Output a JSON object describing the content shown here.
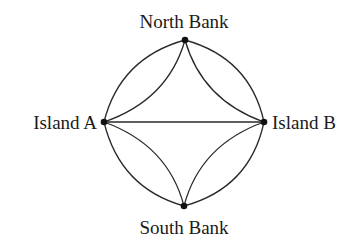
{
  "diagram": {
    "type": "multigraph",
    "nodes": [
      {
        "id": "north",
        "label": "North Bank",
        "x": 185,
        "y": 40
      },
      {
        "id": "islandA",
        "label": "Island A",
        "x": 104,
        "y": 122
      },
      {
        "id": "islandB",
        "label": "Island B",
        "x": 264,
        "y": 122
      },
      {
        "id": "south",
        "label": "South Bank",
        "x": 184,
        "y": 206
      }
    ],
    "edges": [
      {
        "from": "islandA",
        "to": "north",
        "style": "outer-arc"
      },
      {
        "from": "islandA",
        "to": "north",
        "style": "inner-arc"
      },
      {
        "from": "north",
        "to": "islandB",
        "style": "outer-arc"
      },
      {
        "from": "north",
        "to": "islandB",
        "style": "inner-arc"
      },
      {
        "from": "islandA",
        "to": "islandB",
        "style": "straight"
      },
      {
        "from": "islandA",
        "to": "south",
        "style": "outer-arc"
      },
      {
        "from": "islandA",
        "to": "south",
        "style": "inner-arc"
      },
      {
        "from": "south",
        "to": "islandB",
        "style": "outer-arc"
      },
      {
        "from": "south",
        "to": "islandB",
        "style": "inner-arc"
      }
    ]
  },
  "labels": {
    "north": "North Bank",
    "islandA": "Island A",
    "islandB": "Island B",
    "south": "South Bank"
  }
}
